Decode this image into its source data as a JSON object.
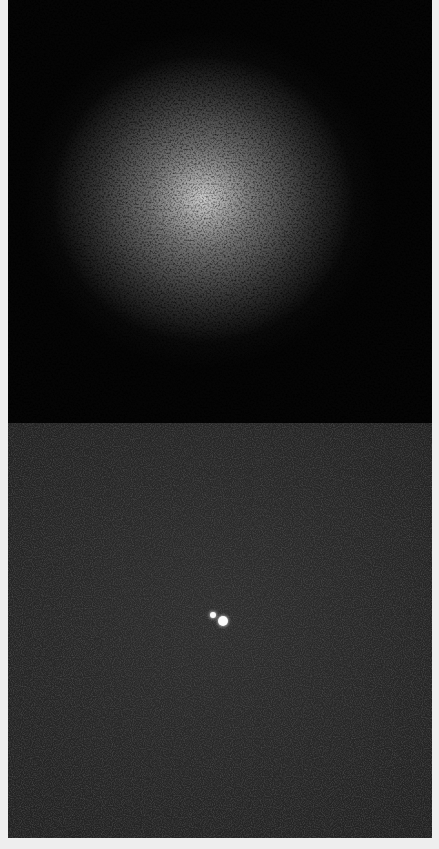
{
  "image": {
    "description": "Two-panel grayscale scientific image: top panel shows noisy speckle/diffraction pattern with bright central blob; bottom panel shows dark noisy background with two small bright point sources near center",
    "panels": [
      {
        "name": "speckle-pattern",
        "background": "#050505",
        "highlight": "#ebebeb"
      },
      {
        "name": "point-sources",
        "background": "#262626",
        "sources": [
          {
            "x": 205,
            "y": 192,
            "diameter": 6
          },
          {
            "x": 215,
            "y": 198,
            "diameter": 10
          }
        ]
      }
    ],
    "frame_color": "#eeeeee"
  }
}
